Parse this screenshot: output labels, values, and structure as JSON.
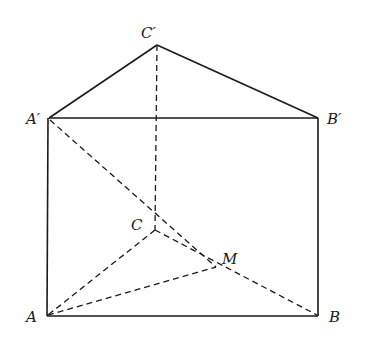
{
  "diagram": {
    "type": "triangular-prism",
    "stroke_color": "#1a1a1a",
    "labels": {
      "Cp": "C′",
      "Ap": "A′",
      "Bp": "B′",
      "C": "C",
      "M": "M",
      "A": "A",
      "B": "B"
    },
    "points": {
      "Cp": [
        157,
        45
      ],
      "Ap": [
        49,
        118
      ],
      "Bp": [
        318,
        118
      ],
      "C": [
        155,
        230
      ],
      "M": [
        216,
        267
      ],
      "A": [
        47,
        316
      ],
      "B": [
        318,
        316
      ]
    },
    "solid_edges": [
      "A'C'",
      "C'B'",
      "A'B'",
      "A'A",
      "B'B",
      "AB"
    ],
    "dashed_edges": [
      "C'C",
      "CA",
      "CB",
      "A'M",
      "AM"
    ]
  }
}
